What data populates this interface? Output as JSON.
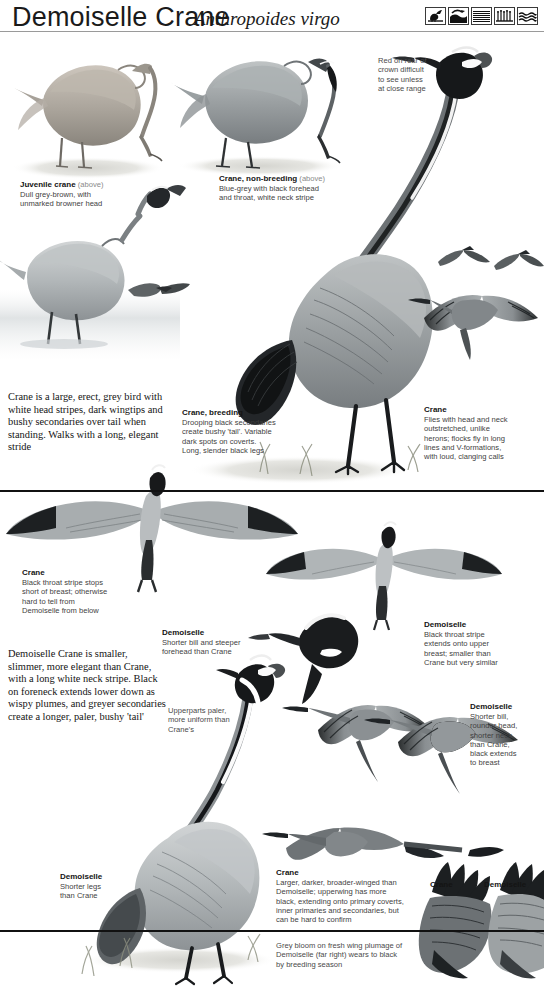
{
  "header": {
    "title": "Demoiselle Crane",
    "scientific_name": "Anthropoides virgo",
    "habitat_icons": [
      {
        "name": "marsh-bird-icon",
        "label": "marsh"
      },
      {
        "name": "wetland-icon",
        "label": "wetland"
      },
      {
        "name": "open-water-icon",
        "label": "open water"
      },
      {
        "name": "grassland-icon",
        "label": "grassland"
      },
      {
        "name": "reedbed-icon",
        "label": "reedbed"
      }
    ]
  },
  "notes": {
    "red_crown": "Red on rear of\ncrown difficult\nto see unless\nat close range",
    "uppers": "Upperparts paler,\nmore uniform than\nCrane's",
    "grey_bloom": "Grey bloom on fresh wing plumage of\nDemoiselle (far right) wears to black\nby breeding season"
  },
  "captions": {
    "juvenile_crane": {
      "title": "Juvenile crane",
      "paren": "(above)",
      "body": "Dull grey-brown, with\nunmarked browner head"
    },
    "crane_nonbreeding": {
      "title": "Crane, non-breeding",
      "paren": "(above)",
      "body": "Blue-grey with black forehead\nand throat, white neck stripe"
    },
    "crane_breeding": {
      "title": "Crane, breeding",
      "paren": "",
      "body": "Drooping black secondaries\ncreate bushy 'tail'. Variable\ndark spots on coverts.\nLong, slender black legs"
    },
    "crane_flight_right": {
      "title": "Crane",
      "paren": "",
      "body": "Flies with head and neck\noutstretched, unlike\nherons; flocks fly in long\nlines and V-formations,\nwith loud, clanging calls"
    },
    "crane_below": {
      "title": "Crane",
      "paren": "",
      "body": "Black throat stripe stops\nshort of breast; otherwise\nhard to tell from\nDemoiselle from below"
    },
    "demoiselle_head": {
      "title": "Demoiselle",
      "paren": "",
      "body": "Shorter bill and steeper\nforehead than Crane"
    },
    "demoiselle_below": {
      "title": "Demoiselle",
      "paren": "",
      "body": "Black throat stripe\nextends onto upper\nbreast; smaller than\nCrane but very similar"
    },
    "demoiselle_head2": {
      "title": "Demoiselle",
      "paren": "",
      "body": "Shorter bill,\nrounder head,\nshorter neck\nthan Crane,\nblack extends\nto breast"
    },
    "demoiselle_legs": {
      "title": "Demoiselle",
      "paren": "",
      "body": "Shorter legs\nthan Crane"
    },
    "crane_upperwing": {
      "title": "Crane",
      "paren": "",
      "body": "Larger, darker, broader-winged than\nDemoiselle; upperwing has more\nblack, extending onto primary coverts,\ninner primaries and secondaries, but\ncan be hard to confirm"
    }
  },
  "paragraphs": {
    "crane_summary": "Crane is a large, erect, grey bird with white head stripes, dark wingtips and bushy secondaries over tail when standing. Walks with a long, elegant stride",
    "demoiselle_summary": "Demoiselle Crane is smaller, slimmer, more elegant than Crane, with a long white neck stripe. Black on foreneck extends lower down as wispy plumes, and greyer secondaries create a longer, paler, bushy 'tail'"
  },
  "wing_labels": {
    "crane": "Crane",
    "demoiselle": "Demoiselle"
  },
  "colors": {
    "ink": "#231f20",
    "body_grey": "#9a9ea0",
    "dark_grey": "#4c5052",
    "black": "#17191a",
    "rule": "#9a9a9a",
    "ground": "#d9d9d4"
  }
}
